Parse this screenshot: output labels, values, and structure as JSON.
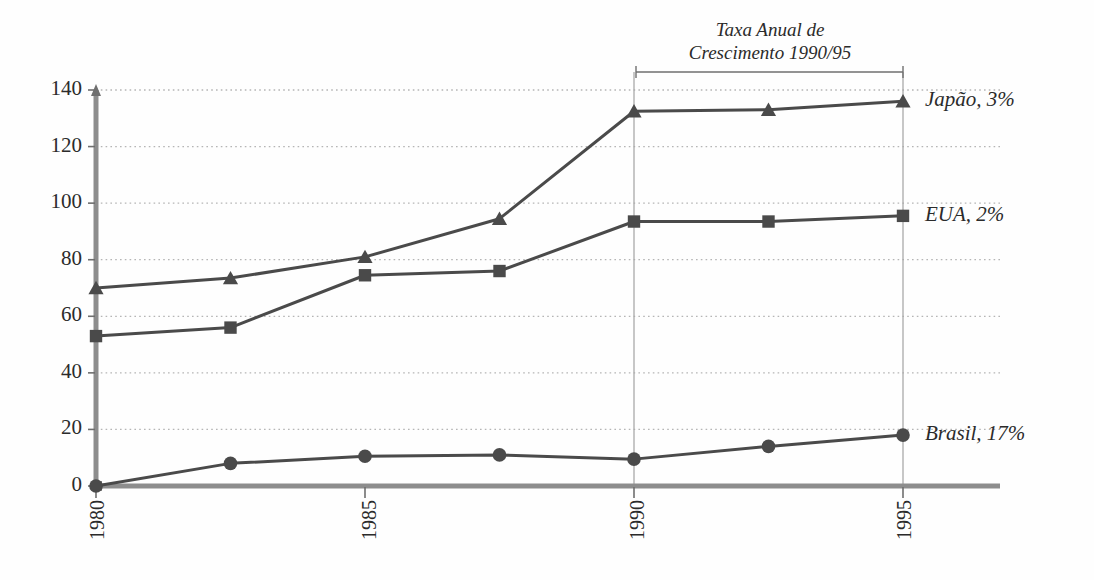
{
  "chart_data": {
    "type": "line",
    "title": "",
    "subtitle": "",
    "xlabel": "",
    "ylabel": "",
    "xlim": [
      1980,
      1995
    ],
    "ylim": [
      0,
      140
    ],
    "yticks": [
      0,
      20,
      40,
      60,
      80,
      100,
      120,
      140
    ],
    "ytick_labels": [
      "0",
      "20",
      "40",
      "60",
      "80",
      "100",
      "120",
      "140"
    ],
    "xticks": [
      1980,
      1985,
      1990,
      1995
    ],
    "xtick_labels": [
      "1980",
      "1985",
      "1990",
      "1995"
    ],
    "x": [
      1980,
      1982.5,
      1985,
      1987.5,
      1990,
      1992.5,
      1995
    ],
    "grid": "horizontal-dotted",
    "legend_position": "right-inline",
    "series": [
      {
        "name": "Japão, 3%",
        "label": "Japão, 3%",
        "marker": "triangle",
        "color": "#4a4a4a",
        "values": [
          70,
          73.5,
          81,
          94.5,
          132.5,
          133,
          136
        ]
      },
      {
        "name": "EUA, 2%",
        "label": "EUA, 2%",
        "marker": "square",
        "color": "#4a4a4a",
        "values": [
          53,
          56,
          74.5,
          76,
          93.5,
          93.5,
          95.5
        ]
      },
      {
        "name": "Brasil, 17%",
        "label": "Brasil, 17%",
        "marker": "circle",
        "color": "#4a4a4a",
        "values": [
          0,
          8,
          10.5,
          11,
          9.5,
          14,
          18
        ]
      }
    ],
    "annotations": [
      {
        "text_line1": "Taxa Anual de",
        "text_line2": "Crescimento 1990/95",
        "span_from": 1990,
        "span_to": 1995,
        "type": "bracket"
      }
    ],
    "reference_lines": [
      {
        "x": 1990,
        "style": "solid-thin"
      },
      {
        "x": 1995,
        "style": "solid-thin"
      }
    ],
    "colors": {
      "axis": "#8d8d8d",
      "series": "#4a4a4a",
      "grid": "#b5b5b5",
      "text": "#2b2b2b",
      "reference": "#a9a9a9"
    }
  },
  "ytick_labels": {
    "t0": "0",
    "t1": "20",
    "t2": "40",
    "t3": "60",
    "t4": "80",
    "t5": "100",
    "t6": "120",
    "t7": "140"
  },
  "xtick_labels": {
    "x0": "1980",
    "x1": "1985",
    "x2": "1990",
    "x3": "1995"
  },
  "series_labels": {
    "japao": "Japão, 3%",
    "eua": "EUA, 2%",
    "brasil": "Brasil, 17%"
  },
  "annotation": {
    "line1": "Taxa Anual de",
    "line2": "Crescimento 1990/95"
  }
}
